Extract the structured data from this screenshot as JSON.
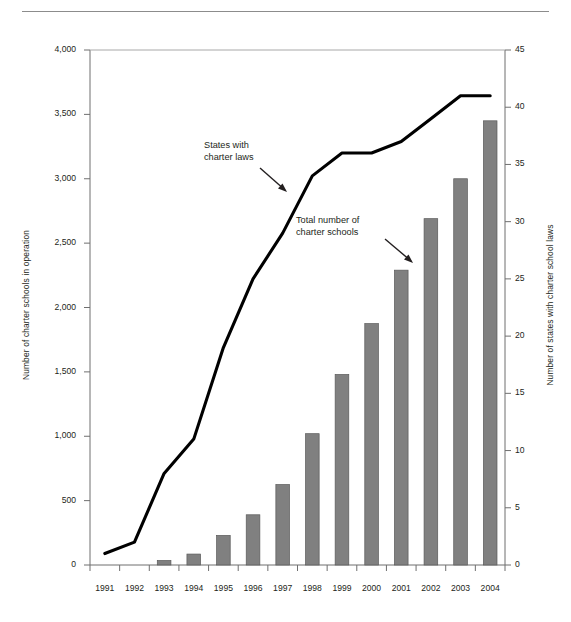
{
  "chart_data": {
    "type": "bar",
    "title": "",
    "subtitle": "",
    "xlabel": "",
    "ylabel": "Number of charter schools in operation",
    "y2label": "Number of states with charter school laws",
    "categories": [
      "1991",
      "1992",
      "1993",
      "1994",
      "1995",
      "1996",
      "1997",
      "1998",
      "1999",
      "2000",
      "2001",
      "2002",
      "2003",
      "2004"
    ],
    "ylim": [
      0,
      4000
    ],
    "y2lim": [
      0,
      45
    ],
    "yticks": [
      "0",
      "500",
      "1,000",
      "1,500",
      "2,000",
      "2,500",
      "3,000",
      "3,500",
      "4,000"
    ],
    "ytick_values": [
      0,
      500,
      1000,
      1500,
      2000,
      2500,
      3000,
      3500,
      4000
    ],
    "y2ticks": [
      "0",
      "5",
      "10",
      "15",
      "20",
      "25",
      "30",
      "35",
      "40",
      "45"
    ],
    "y2tick_values": [
      0,
      5,
      10,
      15,
      20,
      25,
      30,
      35,
      40,
      45
    ],
    "grid": false,
    "legend_position": "annotations",
    "series": [
      {
        "name": "Total number of charter schools",
        "kind": "bar",
        "axis": "left",
        "color": "#808080",
        "values": [
          0,
          0,
          35,
          85,
          230,
          390,
          625,
          1020,
          1480,
          1875,
          2290,
          2690,
          3000,
          3450
        ]
      },
      {
        "name": "States with charter laws",
        "kind": "line",
        "axis": "right",
        "color": "#000000",
        "values": [
          1,
          2,
          8,
          11,
          19,
          25,
          29,
          34,
          36,
          36,
          37,
          39,
          41,
          41
        ]
      }
    ],
    "annotations": [
      {
        "id": "line-annot",
        "text_lines": [
          "States with",
          "charter laws"
        ],
        "target": "States with charter laws"
      },
      {
        "id": "bar-annot",
        "text_lines": [
          "Total number of",
          "charter schools"
        ],
        "target": "Total number of charter schools"
      }
    ]
  },
  "axes": {
    "left_title": "Number of charter schools in operation",
    "right_title": "Number of states with charter school laws"
  },
  "colors": {
    "bar_fill": "#808080",
    "bar_stroke": "#5a5a5a",
    "line": "#000000",
    "axis": "#6f6f6f",
    "text": "#231f20",
    "rule": "#8c8c8c",
    "background": "#ffffff"
  }
}
